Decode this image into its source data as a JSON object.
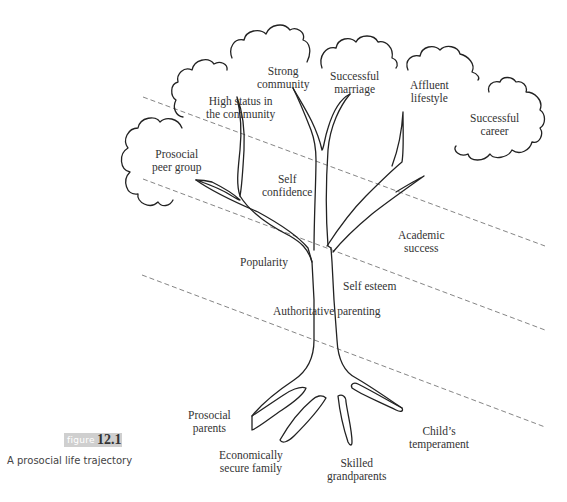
{
  "figure": {
    "tag_word": "figure",
    "number": "12.1",
    "caption": "A prosocial life trajectory"
  },
  "clouds": [
    {
      "line1": "Prosocial",
      "line2": "peer group"
    },
    {
      "line1": "High status in",
      "line2": "the community"
    },
    {
      "line1": "Strong",
      "line2": "community"
    },
    {
      "line1": "Successful",
      "line2": "marriage"
    },
    {
      "line1": "Affluent",
      "line2": "lifestyle"
    },
    {
      "line1": "Successful",
      "line2": "career"
    }
  ],
  "branch_labels": {
    "self_confidence": {
      "line1": "Self",
      "line2": "confidence"
    },
    "academic_success": {
      "line1": "Academic",
      "line2": "success"
    },
    "popularity": "Popularity",
    "self_esteem": "Self esteem",
    "authoritative_parenting": "Authoritative parenting"
  },
  "root_labels": {
    "prosocial_parents": {
      "line1": "Prosocial",
      "line2": "parents"
    },
    "economically_secure_family": {
      "line1": "Economically",
      "line2": "secure family"
    },
    "skilled_grandparents": {
      "line1": "Skilled",
      "line2": "grandparents"
    },
    "childs_temperament": {
      "line1": "Child’s",
      "line2": "temperament"
    }
  },
  "colors": {
    "stroke": "#222222",
    "dash": "#777777",
    "tag_bg": "#cfcfcf"
  }
}
